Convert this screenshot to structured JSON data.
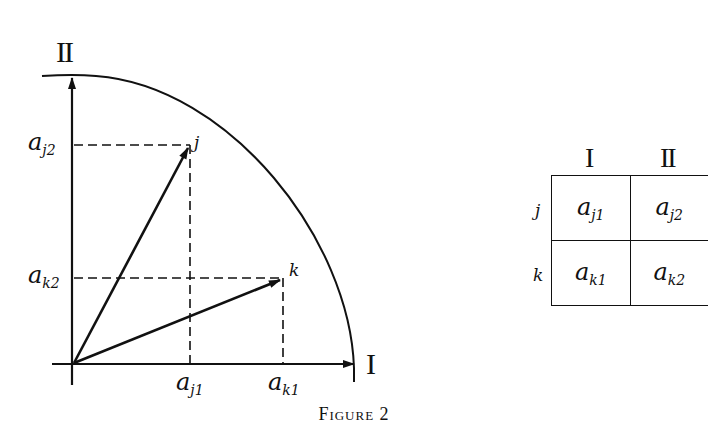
{
  "figure": {
    "caption": "Figure 2",
    "axes": {
      "horizontal_label": "I",
      "vertical_label": "II"
    },
    "points": [
      {
        "name": "j",
        "x_label": "a",
        "x_sub": "j1",
        "y_label": "a",
        "y_sub": "j2"
      },
      {
        "name": "k",
        "x_label": "a",
        "x_sub": "k1",
        "y_label": "a",
        "y_sub": "k2"
      }
    ],
    "table": {
      "col_headers": [
        "I",
        "II"
      ],
      "rows": [
        {
          "label": "j",
          "cells": [
            {
              "base": "a",
              "sub": "j1"
            },
            {
              "base": "a",
              "sub": "j2"
            }
          ]
        },
        {
          "label": "k",
          "cells": [
            {
              "base": "a",
              "sub": "k1"
            },
            {
              "base": "a",
              "sub": "k2"
            }
          ]
        }
      ]
    }
  },
  "colors": {
    "ink": "#111111",
    "background": "#ffffff"
  }
}
